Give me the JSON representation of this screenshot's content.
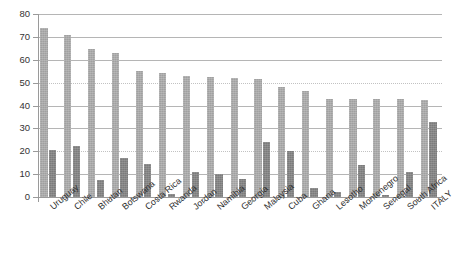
{
  "chart_data": {
    "type": "bar",
    "title": "",
    "subtitle": "",
    "xlabel": "",
    "ylabel": "",
    "ylim": [
      0,
      80
    ],
    "y_ticks": [
      0,
      10,
      20,
      30,
      40,
      50,
      60,
      70,
      80
    ],
    "grid": true,
    "legend": "none",
    "orientation": "vertical",
    "grouping": "grouped",
    "categories": [
      "Uruguay",
      "Chile",
      "Bhutan",
      "Botswana",
      "Costa Rica",
      "Rwanda",
      "Jordan",
      "Namibia",
      "Georgia",
      "Malaysia",
      "Cuba",
      "Ghana",
      "Lesotho",
      "Montenegro",
      "Senegal",
      "South Africa",
      "ITALY"
    ],
    "series": [
      {
        "name": "series-1",
        "color": "#a0a0a0",
        "values": [
          74,
          71,
          64.5,
          63,
          55,
          54,
          53,
          52.5,
          52,
          51.5,
          48,
          46.5,
          43,
          43,
          43,
          43,
          42.5
        ]
      },
      {
        "name": "series-2",
        "color": "#7b7b7b",
        "values": [
          20.5,
          22.5,
          7.5,
          17,
          14.5,
          1.5,
          11,
          10,
          8,
          24,
          20,
          4,
          2,
          14,
          1,
          11,
          33
        ]
      }
    ]
  },
  "axis": {
    "y_tick_labels": [
      "0",
      "10",
      "20",
      "30",
      "40",
      "50",
      "60",
      "70",
      "80"
    ]
  }
}
